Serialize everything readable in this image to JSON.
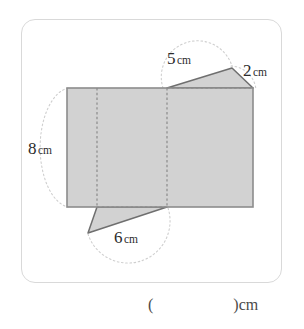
{
  "page": {
    "background_color": "#ffffff",
    "card": {
      "border_color": "#d9d9d9",
      "fill_color": "#ffffff"
    }
  },
  "figure": {
    "name": "net-of-prism-diagram",
    "shape_fill_color": "#d2d2d2",
    "shape_stroke_color": "#7a7a7a",
    "fold_line_color": "#8a8a8a",
    "guide_arc_color": "#cfcfcf"
  },
  "labels": {
    "top_slant": {
      "number": "5",
      "unit": "cm"
    },
    "right_slant": {
      "number": "2",
      "unit": "cm"
    },
    "left_height": {
      "number": "8",
      "unit": "cm"
    },
    "bottom_slant": {
      "number": "6",
      "unit": "cm"
    }
  },
  "answer": {
    "text": "(                    )cm"
  }
}
